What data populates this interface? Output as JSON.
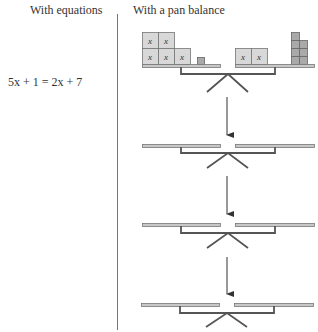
{
  "left_column": {
    "header": "With equations",
    "equation": "5x + 1 = 2x + 7"
  },
  "right_column": {
    "header": "With a pan balance"
  },
  "balance_1": {
    "left_pan": {
      "x_blocks": 5,
      "unit_blocks": 1
    },
    "right_pan": {
      "x_blocks": 2,
      "unit_blocks": 7
    },
    "x_label": "x"
  },
  "steps": 3,
  "colors": {
    "block_fill": "#d8d8d8",
    "unit_fill": "#a9a9a9",
    "pan_fill": "#c8c8c8",
    "beam": "#555555",
    "divider": "#777777"
  }
}
